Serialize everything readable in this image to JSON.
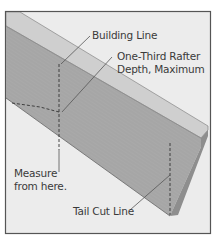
{
  "diagram": {
    "type": "rafter-tail-cut-illustration",
    "labels": {
      "building_line": "Building Line",
      "one_third_line1": "One-Third Rafter",
      "one_third_line2": "Depth, Maximum",
      "measure_line1": "Measure",
      "measure_line2": "from here.",
      "tail_cut_line": "Tail Cut Line"
    },
    "colors": {
      "background": "#ececec",
      "frame_border": "#555555",
      "board_side": "#a9a9a9",
      "board_top": "#cfcfcf",
      "board_end": "#8e8e8e",
      "leader_line": "#555555",
      "dashed_line": "#333333"
    }
  }
}
